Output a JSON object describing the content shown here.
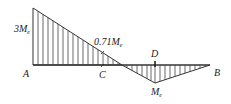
{
  "diagram": {
    "points": {
      "A": "A",
      "B": "B",
      "C": "C",
      "D": "D"
    },
    "labels": {
      "max_moment": "3M",
      "max_moment_sub": "e",
      "c_moment": "0.71M",
      "c_moment_sub": "e",
      "d_moment": "M",
      "d_moment_sub": "e"
    },
    "colors": {
      "line": "#333333",
      "text": "#222222"
    }
  }
}
